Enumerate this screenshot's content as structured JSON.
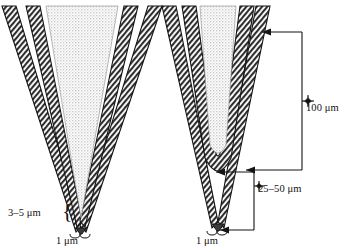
{
  "figure": {
    "left_panel": {
      "name": "blunt-taper-pipette",
      "labels": {
        "shank_diameter": "3–5 μm",
        "tip_diameter": "1 μm"
      }
    },
    "right_panel": {
      "name": "long-taper-pipette",
      "labels": {
        "taper_length": "100 μm",
        "tip_length": "25–50 μm",
        "tip_diameter": "1 μm"
      }
    },
    "units": "μm",
    "colors": {
      "ink": "#111111",
      "wall_hatch": "#3a3a3a",
      "core_stipple": "#d9d9d9",
      "background": "#ffffff"
    }
  }
}
